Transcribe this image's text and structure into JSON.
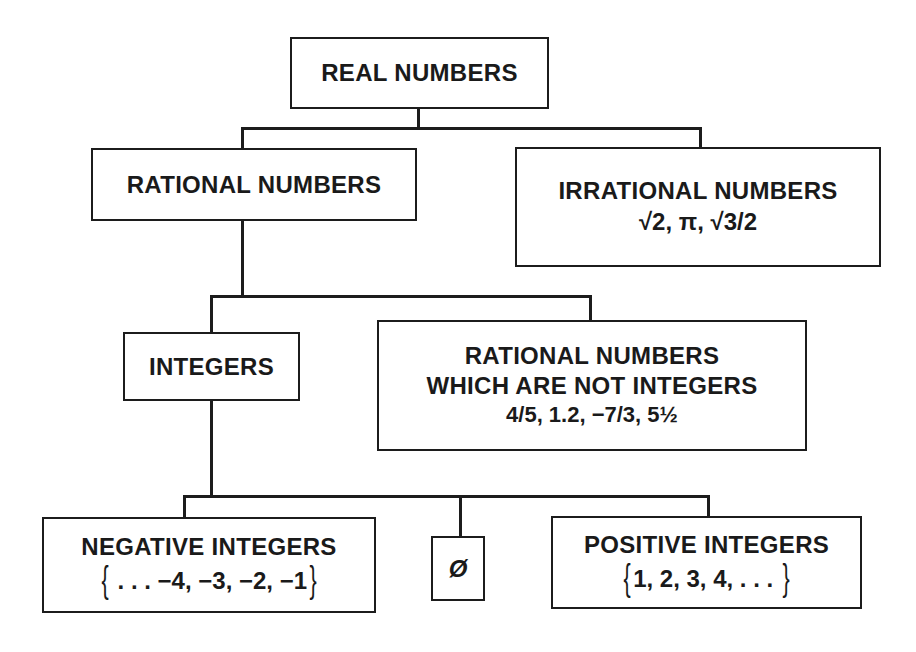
{
  "diagram": {
    "nodes": {
      "real": {
        "label": "REAL NUMBERS"
      },
      "rational": {
        "label": "RATIONAL NUMBERS"
      },
      "irrational": {
        "label": "IRRATIONAL NUMBERS",
        "examples": "√2, π, √3/2"
      },
      "integers": {
        "label": "INTEGERS"
      },
      "non_integer_rationals": {
        "label_line1": "RATIONAL NUMBERS",
        "label_line2": "WHICH ARE NOT INTEGERS",
        "examples": "4/5, 1.2, −7/3, 5½"
      },
      "negative": {
        "label": "NEGATIVE INTEGERS",
        "brace_open": "{",
        "examples": " . . . −4, −3, −2, −1",
        "brace_close": "}"
      },
      "zero": {
        "label": "Ø"
      },
      "positive": {
        "label": "POSITIVE INTEGERS",
        "brace_open": "{",
        "examples": "1, 2, 3, 4, . . . ",
        "brace_close": "}"
      }
    },
    "edges": [
      [
        "REAL NUMBERS",
        "RATIONAL NUMBERS"
      ],
      [
        "REAL NUMBERS",
        "IRRATIONAL NUMBERS"
      ],
      [
        "RATIONAL NUMBERS",
        "INTEGERS"
      ],
      [
        "RATIONAL NUMBERS",
        "RATIONAL NUMBERS WHICH ARE NOT INTEGERS"
      ],
      [
        "INTEGERS",
        "NEGATIVE INTEGERS"
      ],
      [
        "INTEGERS",
        "Ø"
      ],
      [
        "INTEGERS",
        "POSITIVE INTEGERS"
      ]
    ],
    "colors": {
      "ink": "#1c1c1c",
      "background": "#ffffff"
    }
  }
}
